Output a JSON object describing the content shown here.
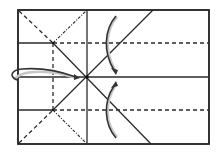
{
  "diagram": {
    "type": "origami-fold-diagram",
    "colors": {
      "line": "#2a2a2a",
      "border": "#1e1e1e",
      "arrow": "#333333",
      "arrow_shadow": "#c8c8c8",
      "background": "#ffffff"
    },
    "sheet": {
      "x1": 18,
      "y1": 10,
      "x2": 209,
      "y2": 144
    },
    "center_point": {
      "x": 87,
      "y": 77
    },
    "line_types": {
      "solid": "crease",
      "dashed": "valley-fold",
      "dash-dot": "mountain-fold"
    },
    "arrows": [
      {
        "name": "fold-down-arrow",
        "from": "top",
        "to": "center"
      },
      {
        "name": "fold-up-arrow",
        "from": "bottom",
        "to": "center"
      },
      {
        "name": "fold-right-arrow",
        "from": "left-edge",
        "to": "center"
      }
    ]
  }
}
